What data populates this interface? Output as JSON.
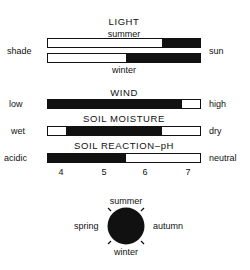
{
  "light": {
    "title": "LIGHT",
    "left_label": "shade",
    "right_label": "sun",
    "summer": {
      "label": "summer",
      "dark_from_pct": 75,
      "dark_to_pct": 100
    },
    "winter": {
      "label": "winter",
      "dark_from_pct": 51,
      "dark_to_pct": 100
    }
  },
  "wind": {
    "title": "WIND",
    "left_label": "low",
    "right_label": "high",
    "dark_from_pct": 0,
    "dark_to_pct": 88
  },
  "soil_moisture": {
    "title": "SOIL MOISTURE",
    "left_label": "wet",
    "right_label": "dry",
    "dark_from_pct": 12,
    "dark_to_pct": 75
  },
  "soil_reaction": {
    "title": "SOIL REACTION–pH",
    "left_label": "acidic",
    "right_label": "neutral",
    "dark_from_pct": 0,
    "dark_to_pct": 51,
    "ticks": [
      "4",
      "5",
      "6",
      "7"
    ]
  },
  "seasons": {
    "top": "summer",
    "left": "spring",
    "right": "autumn",
    "bottom": "winter"
  },
  "colors": {
    "fill": "#111111",
    "empty": "#ffffff"
  }
}
